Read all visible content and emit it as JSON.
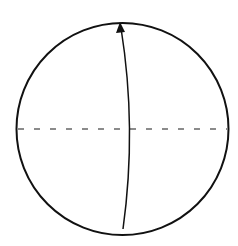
{
  "diagram": {
    "type": "circle-with-meridian-arrow",
    "background": "#ffffff",
    "circle": {
      "cx": 122.5,
      "cy": 129,
      "r": 106,
      "stroke": "#111111",
      "stroke_width": 2
    },
    "equator": {
      "y": 129,
      "x1": 18,
      "x2": 227,
      "stroke": "#666666",
      "dash": "6 10",
      "stroke_width": 1.5
    },
    "arrow": {
      "path": "M 123 229 Q 137 128 121 28",
      "stroke": "#111111",
      "stroke_width": 1.5,
      "head": "120,22 116,33 125,32"
    }
  }
}
